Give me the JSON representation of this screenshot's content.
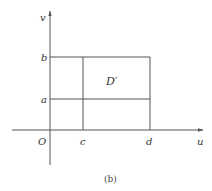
{
  "figure": {
    "caption": "(b)",
    "region_label": "D′",
    "axes": {
      "x_label": "u",
      "y_label": "v",
      "origin_label": "O"
    },
    "ticks": {
      "x": [
        "c",
        "d"
      ],
      "y": [
        "a",
        "b"
      ]
    },
    "colors": {
      "line": "#555555",
      "text": "#333333",
      "background": "#ffffff"
    }
  }
}
